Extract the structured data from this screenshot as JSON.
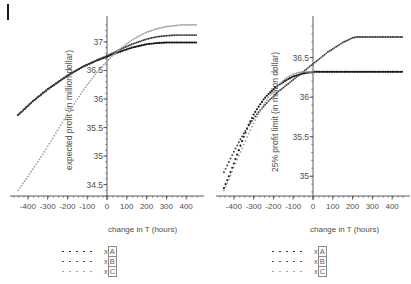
{
  "figure": {
    "background": "#ffffff",
    "dot_color_dark": "#111111",
    "dot_color_mid": "#3a3a3a",
    "dot_color_light": "#9a9a9a",
    "axis_color": "#4a4a4a",
    "corner_mark": "|"
  },
  "legend_common": {
    "entries": [
      {
        "label_prefix": "x",
        "label_index": "A",
        "style": "dark"
      },
      {
        "label_prefix": "x",
        "label_index": "B",
        "style": "mid"
      },
      {
        "label_prefix": "x",
        "label_index": "C",
        "style": "light"
      }
    ]
  },
  "chart_data": [
    {
      "type": "scatter",
      "id": "expected-profit",
      "title": "",
      "xlabel": "change in T (hours)",
      "ylabel": "expected profit (in million dollar)",
      "xlim": [
        -470,
        470
      ],
      "ylim": [
        34.3,
        37.35
      ],
      "xticks": [
        -400,
        -300,
        -200,
        -100,
        0,
        100,
        200,
        300,
        400
      ],
      "xticklabels": [
        "-400",
        "-300",
        "-200",
        "-100",
        "0",
        "100",
        "200",
        "300",
        "400"
      ],
      "yticks": [
        34.5,
        35,
        35.5,
        36,
        36.5,
        37
      ],
      "yticklabels": [
        "34.5",
        "35",
        "35.5",
        "36",
        "36.5",
        "37"
      ],
      "grid": false,
      "legend_position": "below",
      "series": [
        {
          "name": "x[A]",
          "style": "dark",
          "x": [
            -450,
            -425,
            -400,
            -375,
            -350,
            -325,
            -300,
            -275,
            -250,
            -225,
            -200,
            -175,
            -150,
            -125,
            -100,
            -75,
            -50,
            -25,
            0,
            25,
            50,
            75,
            100,
            125,
            150,
            175,
            200,
            225,
            250,
            275,
            300,
            325,
            350,
            375,
            400,
            425,
            450
          ],
          "y": [
            35.72,
            35.8,
            35.88,
            35.96,
            36.03,
            36.1,
            36.17,
            36.23,
            36.29,
            36.35,
            36.41,
            36.46,
            36.51,
            36.56,
            36.6,
            36.64,
            36.68,
            36.71,
            36.74,
            36.78,
            36.81,
            36.84,
            36.87,
            36.9,
            36.92,
            36.94,
            36.96,
            36.97,
            36.98,
            36.985,
            36.99,
            36.99,
            36.99,
            36.99,
            36.99,
            36.99,
            36.99
          ]
        },
        {
          "name": "x[B]",
          "style": "mid",
          "x": [
            -450,
            -425,
            -400,
            -375,
            -350,
            -325,
            -300,
            -275,
            -250,
            -225,
            -200,
            -175,
            -150,
            -125,
            -100,
            -75,
            -50,
            -25,
            0,
            25,
            50,
            75,
            100,
            125,
            150,
            175,
            200,
            225,
            250,
            275,
            300,
            325,
            350,
            375,
            400,
            425,
            450
          ],
          "y": [
            35.72,
            35.8,
            35.88,
            35.96,
            36.03,
            36.1,
            36.17,
            36.23,
            36.29,
            36.35,
            36.41,
            36.46,
            36.51,
            36.56,
            36.6,
            36.64,
            36.68,
            36.72,
            36.76,
            36.8,
            36.84,
            36.88,
            36.92,
            36.96,
            36.99,
            37.02,
            37.05,
            37.07,
            37.09,
            37.1,
            37.11,
            37.115,
            37.12,
            37.12,
            37.12,
            37.12,
            37.12
          ]
        },
        {
          "name": "x[C]",
          "style": "light",
          "x": [
            -450,
            -425,
            -400,
            -375,
            -350,
            -325,
            -300,
            -275,
            -250,
            -225,
            -200,
            -175,
            -150,
            -125,
            -100,
            -75,
            -50,
            -25,
            0,
            25,
            50,
            75,
            100,
            125,
            150,
            175,
            200,
            225,
            250,
            275,
            300,
            325,
            350,
            375,
            400,
            425,
            450
          ],
          "y": [
            34.4,
            34.52,
            34.64,
            34.77,
            34.9,
            35.03,
            35.17,
            35.31,
            35.45,
            35.59,
            35.73,
            35.87,
            36.0,
            36.13,
            36.25,
            36.36,
            36.47,
            36.57,
            36.66,
            36.75,
            36.83,
            36.9,
            36.97,
            37.03,
            37.08,
            37.13,
            37.17,
            37.2,
            37.23,
            37.25,
            37.27,
            37.28,
            37.29,
            37.3,
            37.3,
            37.3,
            37.3
          ]
        }
      ]
    },
    {
      "type": "scatter",
      "id": "profit-limit",
      "title": "",
      "xlabel": "change in T (hours)",
      "ylabel": "25% profit limit (in million dollar)",
      "xlim": [
        -470,
        470
      ],
      "ylim": [
        34.75,
        36.95
      ],
      "xticks": [
        -400,
        -300,
        -200,
        -100,
        0,
        100,
        200,
        300,
        400
      ],
      "xticklabels": [
        "-400",
        "-300",
        "-200",
        "-100",
        "0",
        "100",
        "200",
        "300",
        "400"
      ],
      "yticks": [
        35,
        35.5,
        36,
        36.5
      ],
      "yticklabels": [
        "35",
        "35.5",
        "36",
        "36.5"
      ],
      "grid": false,
      "legend_position": "below",
      "series": [
        {
          "name": "x[A]",
          "style": "dark",
          "x": [
            -450,
            -425,
            -400,
            -375,
            -350,
            -325,
            -300,
            -275,
            -250,
            -225,
            -200,
            -175,
            -150,
            -125,
            -100,
            -75,
            -50,
            -25,
            0,
            25,
            50,
            75,
            100,
            125,
            150,
            175,
            200,
            225,
            250,
            275,
            300,
            325,
            350,
            375,
            400,
            425,
            450
          ],
          "y": [
            34.85,
            35.0,
            35.16,
            35.33,
            35.5,
            35.65,
            35.78,
            35.88,
            35.97,
            36.04,
            36.1,
            36.15,
            36.19,
            36.23,
            36.26,
            36.28,
            36.3,
            36.31,
            36.32,
            36.32,
            36.32,
            36.32,
            36.32,
            36.32,
            36.32,
            36.32,
            36.32,
            36.32,
            36.32,
            36.32,
            36.32,
            36.32,
            36.32,
            36.32,
            36.32,
            36.32,
            36.32
          ]
        },
        {
          "name": "x[B]",
          "style": "mid",
          "x": [
            -450,
            -425,
            -400,
            -375,
            -350,
            -325,
            -300,
            -275,
            -250,
            -225,
            -200,
            -175,
            -150,
            -125,
            -100,
            -75,
            -50,
            -25,
            0,
            25,
            50,
            75,
            100,
            125,
            150,
            175,
            200,
            225,
            250,
            275,
            300,
            325,
            350,
            375,
            400,
            425,
            450
          ],
          "y": [
            35.05,
            35.18,
            35.31,
            35.43,
            35.54,
            35.64,
            35.73,
            35.81,
            35.88,
            35.95,
            36.01,
            36.07,
            36.12,
            36.17,
            36.22,
            36.27,
            36.32,
            36.37,
            36.42,
            36.47,
            36.52,
            36.57,
            36.61,
            36.65,
            36.69,
            36.72,
            36.75,
            36.76,
            36.76,
            36.76,
            36.76,
            36.76,
            36.76,
            36.76,
            36.76,
            36.76,
            36.76
          ]
        },
        {
          "name": "x[C]",
          "style": "light",
          "x": [
            -450,
            -425,
            -400,
            -375,
            -350,
            -325,
            -300,
            -275,
            -250,
            -225,
            -200,
            -175,
            -150,
            -125,
            -100,
            -75,
            -50,
            -25,
            0
          ],
          "y": [
            34.82,
            34.96,
            35.11,
            35.26,
            35.4,
            35.54,
            35.67,
            35.79,
            35.9,
            36.0,
            36.08,
            36.15,
            36.21,
            36.26,
            36.29,
            36.31,
            36.32,
            36.32,
            36.32
          ]
        }
      ]
    }
  ]
}
